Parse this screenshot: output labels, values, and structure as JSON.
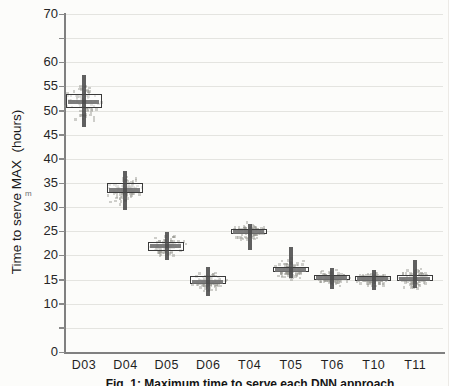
{
  "figure": {
    "caption": "Fig. 1: Maximum time to serve each DNN approach",
    "artifact_mark": "m"
  },
  "chart_data": {
    "type": "boxplot",
    "title": "",
    "xlabel": "",
    "ylabel": "Time to serve MAX  (hours)",
    "ylim": [
      0,
      70
    ],
    "ytick_step": 5,
    "ytick_labels": [
      70,
      60,
      55,
      50,
      45,
      40,
      35,
      30,
      25,
      20,
      15,
      10,
      0
    ],
    "grid": true,
    "legend": "none",
    "categories": [
      "D03",
      "D04",
      "D05",
      "D06",
      "T04",
      "T05",
      "T06",
      "T10",
      "T11"
    ],
    "series": [
      {
        "category": "D03",
        "whisker_low": 46.5,
        "q1": 50.4,
        "median": 51.8,
        "q3": 53.4,
        "whisker_high": 57.3
      },
      {
        "category": "D04",
        "whisker_low": 29.5,
        "q1": 32.7,
        "median": 33.6,
        "q3": 35.0,
        "whisker_high": 37.5
      },
      {
        "category": "D05",
        "whisker_low": 19.0,
        "q1": 20.8,
        "median": 21.9,
        "q3": 22.7,
        "whisker_high": 24.9
      },
      {
        "category": "D06",
        "whisker_low": 11.5,
        "q1": 13.9,
        "median": 14.6,
        "q3": 15.7,
        "whisker_high": 17.6
      },
      {
        "category": "T04",
        "whisker_low": 21.2,
        "q1": 24.2,
        "median": 24.9,
        "q3": 25.5,
        "whisker_high": 26.6
      },
      {
        "category": "T05",
        "whisker_low": 15.4,
        "q1": 16.4,
        "median": 17.0,
        "q3": 17.6,
        "whisker_high": 21.7
      },
      {
        "category": "T06",
        "whisker_low": 13.0,
        "q1": 14.7,
        "median": 15.3,
        "q3": 15.9,
        "whisker_high": 17.4
      },
      {
        "category": "T10",
        "whisker_low": 12.8,
        "q1": 14.6,
        "median": 15.1,
        "q3": 15.7,
        "whisker_high": 17.0
      },
      {
        "category": "T11",
        "whisker_low": 13.3,
        "q1": 14.4,
        "median": 15.2,
        "q3": 15.9,
        "whisker_high": 19.0
      }
    ],
    "colors": {
      "paper": "#fcfcfa",
      "grid": "#e4e4e0",
      "axis": "#808080",
      "box_border": "#3a3a3a",
      "median": "#707070",
      "whisker": "#4a4a4a",
      "jitter_cloud": "#9a9a90"
    }
  }
}
